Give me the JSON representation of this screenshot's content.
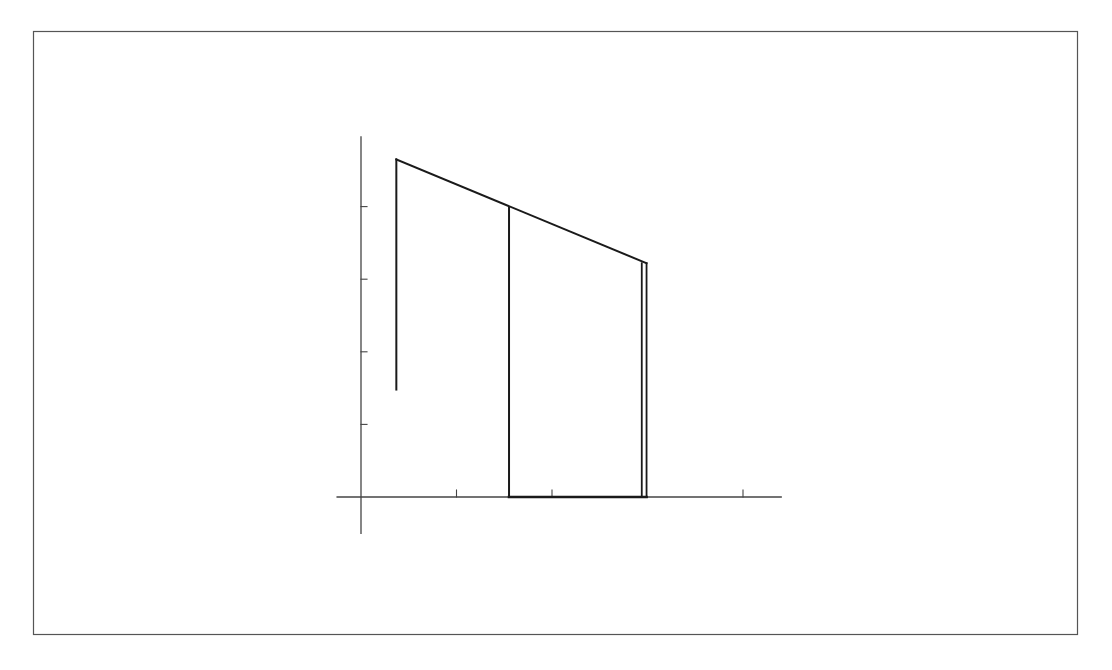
{
  "figure": {
    "stroke_color": "#1a1a1a",
    "axis_color": "#444444",
    "frame_color": "#555555",
    "background": "#ffffff"
  },
  "axes": {
    "x_ticks": [
      1,
      2,
      4
    ],
    "y_ticks": [
      1,
      2,
      3,
      4
    ],
    "x_range": [
      -0.25,
      4.4
    ],
    "y_range": [
      -0.5,
      5.0
    ],
    "tick_labels_shown": false
  },
  "shapes": {
    "top_edge": {
      "from": [
        0.37,
        4.65
      ],
      "to": [
        2.99,
        3.22
      ]
    },
    "left_drop": {
      "x": 0.37,
      "y_from": 4.65,
      "y_to": 1.48
    },
    "middle_drop": {
      "x": 1.55,
      "y_from": 3.98,
      "y_to": 0
    },
    "right_edge_inner": {
      "x": 2.94,
      "y_from": 3.22,
      "y_to": 0
    },
    "right_edge_outer": {
      "x": 2.99,
      "y_from": 3.22,
      "y_to": 0
    },
    "base_segment": {
      "x_from": 1.55,
      "x_to": 2.99,
      "y": 0
    }
  }
}
